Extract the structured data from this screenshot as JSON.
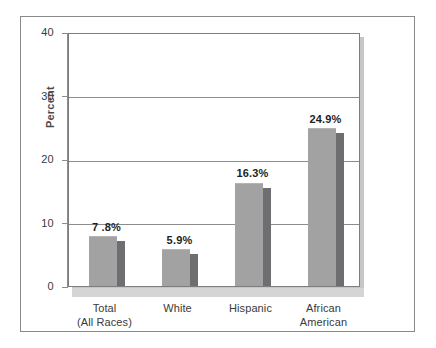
{
  "chart_data": {
    "type": "bar",
    "title": "",
    "subtitle": "",
    "xlabel": "",
    "ylabel": "Percent",
    "ylim": [
      0,
      40
    ],
    "yticks": [
      0,
      10,
      20,
      30,
      40
    ],
    "ytick_labels": [
      "0",
      "10",
      "20",
      "30",
      "40"
    ],
    "grid": true,
    "legend": "none",
    "categories": [
      {
        "line1": "Total",
        "line2": "(All Races)"
      },
      {
        "line1": "White",
        "line2": ""
      },
      {
        "line1": "Hispanic",
        "line2": ""
      },
      {
        "line1": "African",
        "line2": "American"
      }
    ],
    "category_labels": [
      "Total (All Races)",
      "White",
      "Hispanic",
      "African American"
    ],
    "values": [
      7.8,
      5.9,
      16.3,
      24.9
    ],
    "value_labels": [
      "7 .8%",
      "5.9%",
      "16.3%",
      "24.9%"
    ],
    "series": [
      {
        "name": "Percent",
        "values": [
          7.8,
          5.9,
          16.3,
          24.9
        ]
      }
    ],
    "colors": {
      "bar_face": "#a2a2a2",
      "bar_shadow": "#6e6e70",
      "gridline": "#8c8c8c",
      "axis": "#8c8c8c",
      "frame": "#8a8a8a",
      "plot_drop_shadow": "#c6c6c6",
      "floor_band": "#d5d5d5",
      "text": "#3a3a3a",
      "value_text": "#1e1e1e"
    }
  }
}
